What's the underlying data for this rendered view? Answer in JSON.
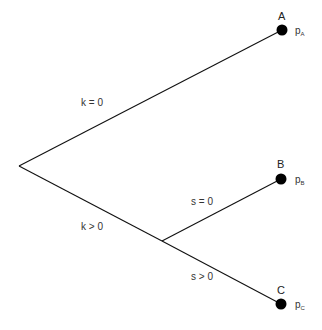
{
  "diagram": {
    "type": "decision-tree",
    "root": {
      "x": 19,
      "y": 166
    },
    "junction": {
      "x": 162,
      "y": 241
    },
    "nodes": [
      {
        "id": "A",
        "label": "A",
        "prob_base": "p",
        "prob_sub": "A",
        "x": 282,
        "y": 30
      },
      {
        "id": "B",
        "label": "B",
        "prob_base": "p",
        "prob_sub": "B",
        "x": 281,
        "y": 179
      },
      {
        "id": "C",
        "label": "C",
        "prob_base": "p",
        "prob_sub": "C",
        "x": 281,
        "y": 304
      }
    ],
    "edges": [
      {
        "from": "root",
        "to": "A",
        "label": "k = 0"
      },
      {
        "from": "root",
        "to": "junction",
        "label": "k > 0"
      },
      {
        "from": "junction",
        "to": "B",
        "label": "s = 0"
      },
      {
        "from": "junction",
        "to": "C",
        "label": "s > 0"
      }
    ],
    "colors": {
      "line": "#111111",
      "node": "#000000",
      "text": "#333333"
    }
  }
}
